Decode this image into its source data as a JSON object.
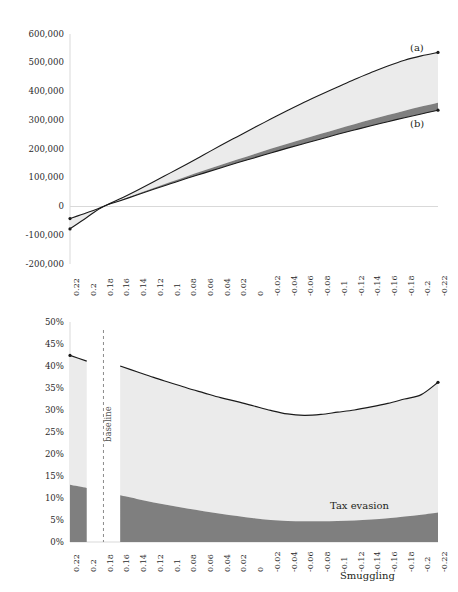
{
  "figure": {
    "background": "#ffffff",
    "colors": {
      "line": "#1a1a1a",
      "band_light": "#ebebeb",
      "band_dark": "#7f7f7f",
      "axis": "#d9d9d9",
      "text": "#231f20",
      "baseline": "#8c8c8c"
    }
  },
  "chart_data": [
    {
      "id": "top",
      "type": "area",
      "title": "",
      "xlabel": "",
      "ylabel": "",
      "grid": false,
      "legend_position": "inline-annotation",
      "x": [
        0.22,
        0.2,
        0.18,
        0.16,
        0.14,
        0.12,
        0.1,
        0.08,
        0.06,
        0.04,
        0.02,
        0,
        -0.02,
        -0.04,
        -0.06,
        -0.08,
        -0.1,
        -0.12,
        -0.14,
        -0.16,
        -0.18,
        -0.2,
        -0.22
      ],
      "xtick_labels": [
        "0.22",
        "0.2",
        "0.18",
        "0.16",
        "0.14",
        "0.12",
        "0.1",
        "0.08",
        "0.06",
        "0.04",
        "0.02",
        "0",
        "-0.02",
        "-0.04",
        "-0.06",
        "-0.08",
        "-0.1",
        "-0.12",
        "-0.14",
        "-0.16",
        "-0.18",
        "-0.2",
        "-0.22"
      ],
      "ytick_labels": [
        "600,000",
        "500,000",
        "400,000",
        "300,000",
        "200,000",
        "100,000",
        "0",
        "-100,000",
        "-200,000"
      ],
      "ytick_values": [
        600000,
        500000,
        400000,
        300000,
        200000,
        100000,
        0,
        -100000,
        -200000
      ],
      "ylim": [
        -200000,
        600000
      ],
      "series": [
        {
          "name": "(a)",
          "label": "(a)",
          "values": [
            -42000,
            -22000,
            0,
            27000,
            56000,
            86000,
            117000,
            148000,
            180000,
            212000,
            243000,
            274000,
            304000,
            334000,
            363000,
            390000,
            416000,
            442000,
            466000,
            489000,
            509000,
            524000,
            536000
          ]
        },
        {
          "name": "(b)",
          "label": "(b)",
          "values": [
            -78000,
            -38000,
            0,
            20000,
            40000,
            60000,
            79000,
            98000,
            116000,
            134000,
            152000,
            169000,
            186000,
            203000,
            219000,
            235000,
            251000,
            266000,
            281000,
            295000,
            309000,
            322000,
            335000
          ]
        },
        {
          "name": "(b)-upper-band",
          "label": "",
          "values": [
            -78000,
            -38000,
            0,
            21500,
            43500,
            64500,
            85000,
            105500,
            125000,
            144500,
            163500,
            182000,
            200500,
            218500,
            236000,
            253000,
            270000,
            286500,
            302500,
            318000,
            333000,
            347500,
            361000
          ]
        }
      ],
      "annotations": [
        {
          "text": "(a)",
          "x": 410,
          "y": 42
        },
        {
          "text": "(b)",
          "x": 410,
          "y": 118
        }
      ]
    },
    {
      "id": "bottom",
      "type": "area",
      "title": "",
      "xlabel": "",
      "ylabel": "",
      "grid": false,
      "stacked": true,
      "legend_position": "inline-annotation",
      "x": [
        0.22,
        0.2,
        0.18,
        0.16,
        0.14,
        0.12,
        0.1,
        0.08,
        0.06,
        0.04,
        0.02,
        0,
        -0.02,
        -0.04,
        -0.06,
        -0.08,
        -0.1,
        -0.12,
        -0.14,
        -0.16,
        -0.18,
        -0.2,
        -0.22
      ],
      "xtick_labels": [
        "0.22",
        "0.2",
        "0.18",
        "0.16",
        "0.14",
        "0.12",
        "0.1",
        "0.08",
        "0.06",
        "0.04",
        "0.02",
        "0",
        "-0.02",
        "-0.04",
        "-0.06",
        "-0.08",
        "-0.1",
        "-0.12",
        "-0.14",
        "-0.16",
        "-0.18",
        "-0.2",
        "-0.22"
      ],
      "ytick_labels": [
        "50%",
        "45%",
        "40%",
        "35%",
        "30%",
        "25%",
        "20%",
        "15%",
        "10%",
        "5%",
        "0%"
      ],
      "ytick_values": [
        50,
        45,
        40,
        35,
        30,
        25,
        20,
        15,
        10,
        5,
        0
      ],
      "ylim": [
        0,
        50
      ],
      "baseline_marker": {
        "label": "baseline",
        "x": 0.19,
        "style": "dashed-vertical"
      },
      "series": [
        {
          "name": "Smuggling",
          "label": "Smuggling",
          "values": [
            13.0,
            12.3,
            null,
            10.6,
            9.8,
            9.0,
            8.3,
            7.6,
            7.0,
            6.4,
            5.9,
            5.4,
            5.0,
            4.8,
            4.7,
            4.7,
            4.8,
            4.9,
            5.1,
            5.4,
            5.8,
            6.2,
            6.7
          ]
        },
        {
          "name": "Tax evasion",
          "label": "Tax evasion",
          "values": [
            29.4,
            28.8,
            null,
            29.4,
            28.9,
            28.4,
            27.9,
            27.4,
            26.9,
            26.4,
            26.0,
            25.5,
            24.9,
            24.3,
            24.1,
            24.3,
            24.7,
            25.1,
            25.6,
            26.1,
            26.7,
            27.3,
            29.6
          ]
        },
        {
          "name": "Total",
          "label": "",
          "values": [
            42.4,
            41.1,
            null,
            40.0,
            38.7,
            37.4,
            36.2,
            35.0,
            33.9,
            32.8,
            31.9,
            30.9,
            29.9,
            29.1,
            28.8,
            29.0,
            29.5,
            30.0,
            30.7,
            31.5,
            32.5,
            33.5,
            36.3
          ]
        }
      ],
      "annotations": [
        {
          "text": "Tax evasion",
          "x": 330,
          "y": 178
        },
        {
          "text": "Smuggling",
          "x": 340,
          "y": 248
        },
        {
          "text": "baseline",
          "x": 103,
          "y": 60
        }
      ]
    }
  ]
}
